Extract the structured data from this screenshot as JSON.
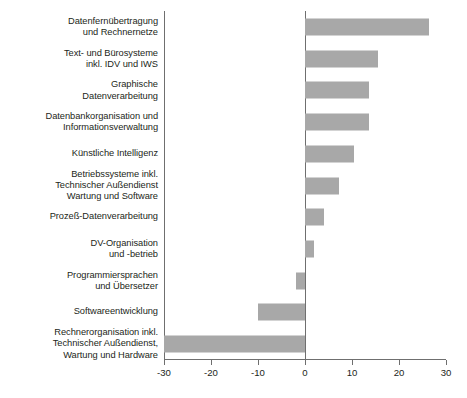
{
  "chart_data": {
    "type": "bar",
    "orientation": "horizontal",
    "title": "",
    "subtitle": "",
    "xlabel": "",
    "ylabel": "",
    "xlim": [
      -30,
      30
    ],
    "xticks": [
      -30,
      -20,
      -10,
      0,
      10,
      20,
      30
    ],
    "xticklabels": [
      "-30",
      "-20",
      "-10",
      "0",
      "10",
      "20",
      "30"
    ],
    "grid": false,
    "legend": null,
    "zero_reference_line": true,
    "bar_color": "#a8a8a8",
    "axis_color": "#6f6f6f",
    "text_color": "#231f20",
    "categories": [
      "Datenfernübertragung\nund Rechnernetze",
      "Text- und Bürosysteme\ninkl. IDV und IWS",
      "Graphische\nDatenverarbeitung",
      "Datenbankorganisation und\nInformationsverwaltung",
      "Künstliche Intelligenz",
      "Betriebssysteme inkl.\nTechnischer Außendienst\nWartung und Software",
      "Prozeß-Datenverarbeitung",
      "DV-Organisation\nund -betrieb",
      "Programmiersprachen\nund Übersetzer",
      "Softwareentwicklung",
      "Rechnerorganisation inkl.\nTechnischer Außendienst,\nWartung und Hardware"
    ],
    "values": [
      26.3,
      15.6,
      13.7,
      13.7,
      10.5,
      7.3,
      4.0,
      2.0,
      -1.9,
      -10.0,
      -30.0
    ]
  }
}
